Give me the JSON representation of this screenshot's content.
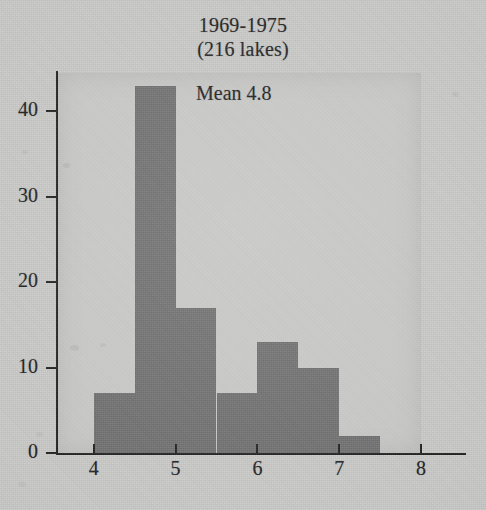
{
  "chart_data": {
    "type": "bar",
    "title": "1969-1975",
    "subtitle": "(216 lakes)",
    "annotation": "Mean 4.8",
    "xlabel": "",
    "ylabel": "",
    "bin_width": 0.5,
    "bin_starts": [
      4.0,
      4.5,
      5.0,
      5.5,
      6.0,
      6.5,
      7.0
    ],
    "bin_ends": [
      4.5,
      5.0,
      5.5,
      6.0,
      6.5,
      7.0,
      7.5
    ],
    "categories": [
      "4.0-4.5",
      "4.5-5.0",
      "5.0-5.5",
      "5.5-6.0",
      "6.0-6.5",
      "6.5-7.0",
      "7.0-7.5"
    ],
    "values": [
      7,
      43,
      17,
      7,
      13,
      10,
      2
    ],
    "xlim": [
      3.55,
      8.0
    ],
    "ylim": [
      0,
      44.5
    ],
    "xticks": [
      4,
      5,
      6,
      7,
      8
    ],
    "xtick_labels": [
      "4",
      "5",
      "6",
      "7",
      "8"
    ],
    "yticks": [
      0,
      10,
      20,
      30,
      40
    ],
    "ytick_labels": [
      "0",
      "10",
      "20",
      "30",
      "40"
    ],
    "grid": false,
    "legend": "none",
    "bar_color": "#6f6f6f",
    "panel_color": "#cdcdcb",
    "axis_color": "#1f1f1f",
    "text_color": "#1d1d1d"
  }
}
